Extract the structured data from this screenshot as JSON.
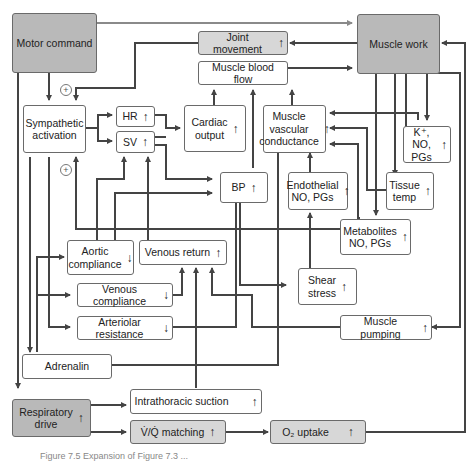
{
  "diagram": {
    "boxes": {
      "motor_command": {
        "label": "Motor command"
      },
      "muscle_work": {
        "label": "Muscle work"
      },
      "joint_movement": {
        "label": "Joint movement",
        "arrow": "↑"
      },
      "muscle_blood_flow": {
        "label": "Muscle blood flow"
      },
      "sympathetic_activation": {
        "label": "Sympathetic\nactivation"
      },
      "hr": {
        "label": "HR",
        "arrow": "↑"
      },
      "sv": {
        "label": "SV",
        "arrow": "↑"
      },
      "cardiac_output": {
        "label": "Cardiac\noutput",
        "arrow": "↑"
      },
      "muscle_vascular_conductance": {
        "label": "Muscle\nvascular\nconductance",
        "arrow": "↑"
      },
      "k_no_pgs": {
        "label": "K⁺, NO,\nPGs",
        "arrow": "↑"
      },
      "bp": {
        "label": "BP",
        "arrow": "↑"
      },
      "endothelial_no_pgs": {
        "label": "Endothelial\nNO, PGs",
        "arrow": "↑"
      },
      "tissue_temp": {
        "label": "Tissue\ntemp",
        "arrow": "↑"
      },
      "metabolites": {
        "label": "Metabolites\nNO, PGs",
        "arrow": "↑"
      },
      "aortic_compliance": {
        "label": "Aortic\ncompliance",
        "arrow": "↓"
      },
      "venous_return": {
        "label": "Venous return",
        "arrow": "↑"
      },
      "shear_stress": {
        "label": "Shear\nstress",
        "arrow": "↑"
      },
      "venous_compliance": {
        "label": "Venous compliance",
        "arrow": "↓"
      },
      "arteriolar_resistance": {
        "label": "Arteriolar resistance",
        "arrow": "↓"
      },
      "muscle_pumping": {
        "label": "Muscle pumping",
        "arrow": "↑"
      },
      "adrenalin": {
        "label": "Adrenalin"
      },
      "respiratory_drive": {
        "label": "Respiratory\ndrive",
        "arrow": "↑"
      },
      "intrathoracic_suction": {
        "label": "Intrathoracic suction",
        "arrow": "↑"
      },
      "vq_matching": {
        "label": "V̇/Q̇ matching",
        "arrow": "↑"
      },
      "o2_uptake": {
        "label": "O₂ uptake",
        "arrow": "↑"
      }
    },
    "signs": {
      "plus_top": "+",
      "plus_mid": "+"
    },
    "colors": {
      "dark_box": "#b9b9b9",
      "light_box": "#d7d7d7",
      "line": "#444444",
      "top_line": "#8a8a8a"
    },
    "caption": "Figure 7.5  Expansion of Figure 7.3 ..."
  }
}
